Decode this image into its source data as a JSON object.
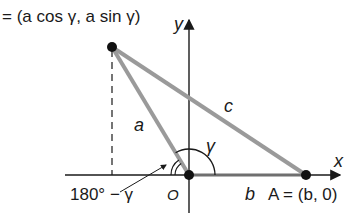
{
  "diagram": {
    "point_b_label": "= (a cos γ, a sin γ)",
    "top_cut_text": "B = (a cos γ, a sin γ)",
    "axis_x_label": "x",
    "axis_y_label": "y",
    "side_a_label": "a",
    "side_b_label": "b",
    "side_c_label": "c",
    "angle_gamma_label": "γ",
    "supplementary_angle_label": "180° − γ",
    "origin_label": "O",
    "point_a_label": "A = (b, 0)",
    "colors": {
      "triangle_side": "#9a9a9a",
      "axis": "#1a1a1a",
      "point": "#111111",
      "background": "#ffffff"
    },
    "points": {
      "origin": [
        189,
        175
      ],
      "A": [
        306,
        175
      ],
      "B": [
        112,
        47
      ]
    }
  }
}
